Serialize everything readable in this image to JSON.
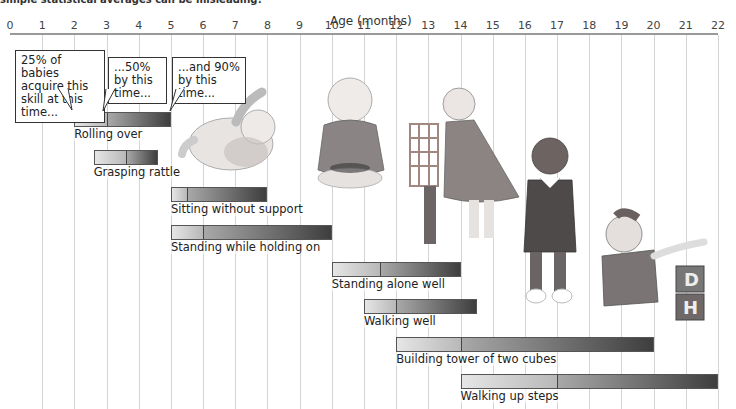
{
  "header": {
    "caption": "simple statistical averages can be misleading!"
  },
  "callouts": [
    {
      "text": "25% of babies acquire this skill at this time..."
    },
    {
      "text": "...50% by this time..."
    },
    {
      "text": "...and 90% by this time..."
    }
  ],
  "illustrations": [
    {
      "name": "baby-rolling-illustration"
    },
    {
      "name": "baby-sitting-illustration"
    },
    {
      "name": "baby-standing-holding-illustration"
    },
    {
      "name": "toddler-walking-illustration"
    },
    {
      "name": "toddler-with-blocks-illustration"
    }
  ],
  "chart_data": {
    "type": "bar",
    "subtype": "range-timeline",
    "title": "simple statistical averages can be misleading!",
    "xlabel": "Age (months)",
    "ylabel": "",
    "xlim": [
      0,
      22
    ],
    "x_ticks": [
      0,
      1,
      2,
      3,
      4,
      5,
      6,
      7,
      8,
      9,
      10,
      11,
      12,
      13,
      14,
      15,
      16,
      17,
      18,
      19,
      20,
      21,
      22
    ],
    "grid": true,
    "legend": {
      "position": "annotations on first bar",
      "entries": [
        "25% of babies acquire this skill at this time...",
        "...50% by this time...",
        "...and 90% by this time..."
      ]
    },
    "categories": [
      "Rolling over",
      "Grasping rattle",
      "Sitting without support",
      "Standing while holding on",
      "Standing alone well",
      "Walking well",
      "Building tower of two cubes",
      "Walking up steps"
    ],
    "series": [
      {
        "name": "25%",
        "values": [
          2,
          2.6,
          5,
          5,
          10,
          11,
          12,
          14
        ]
      },
      {
        "name": "50%",
        "values": [
          3,
          3.6,
          5.5,
          6,
          11.5,
          12,
          14,
          17
        ]
      },
      {
        "name": "90%",
        "values": [
          5,
          4.6,
          8,
          10,
          14,
          14.5,
          20,
          22
        ]
      }
    ]
  }
}
